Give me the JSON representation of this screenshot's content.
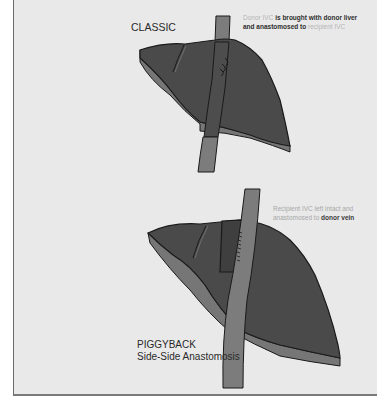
{
  "diagram": {
    "colors": {
      "background": "#e9e9e9",
      "liver_top": "#4a4a4a",
      "liver_side": "#767676",
      "ivc": "#7c7c7c",
      "outline": "#1a1a1a"
    },
    "classic": {
      "label": "CLASSIC",
      "note": {
        "part1": "Donor IVC",
        "part2": " is brought with donor liver and anastomosed to ",
        "part3": "recipient IVC"
      }
    },
    "piggyback": {
      "label_line1": "PIGGYBACK",
      "label_line2": "Side-Side Anastomosis",
      "note": {
        "part1": "Recipient IVC left intact and anastomosed to ",
        "part2": "donor vein"
      }
    }
  }
}
